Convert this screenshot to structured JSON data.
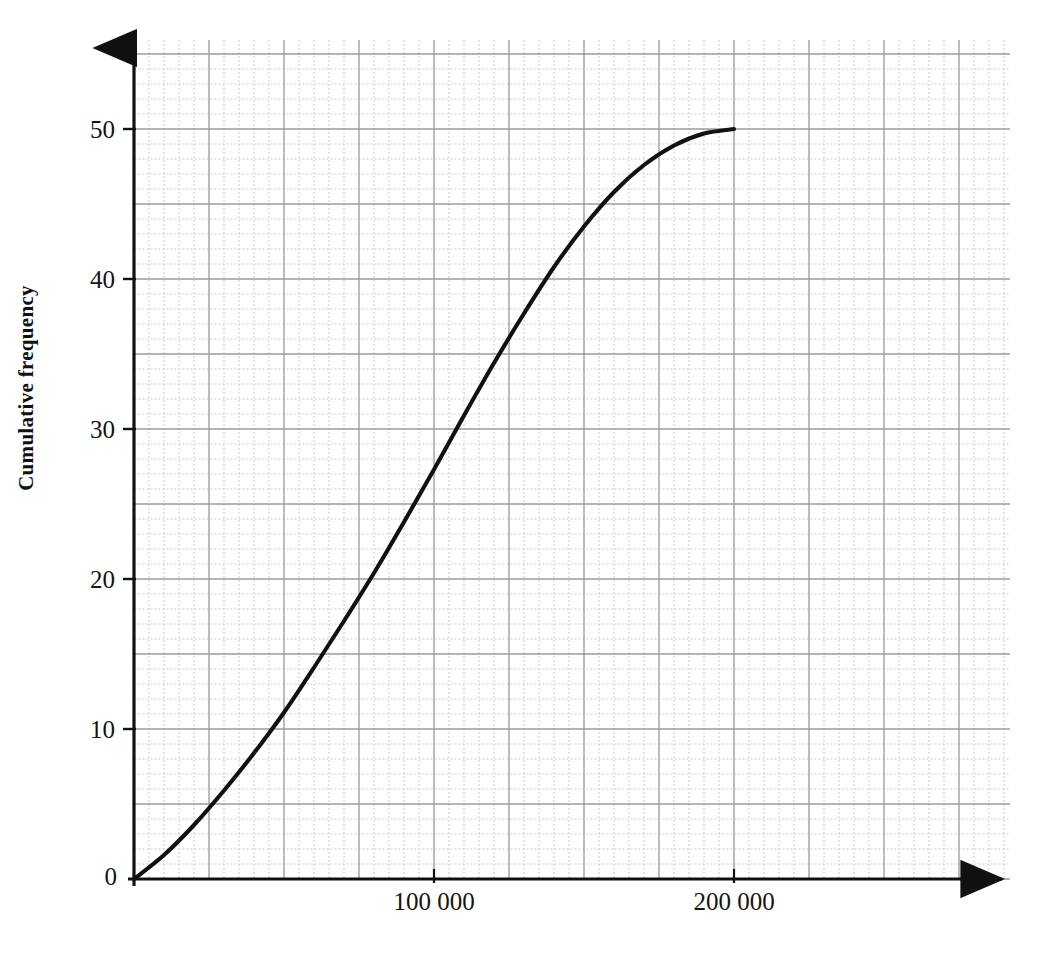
{
  "chart_data": {
    "type": "line",
    "title": "",
    "subtitle": "",
    "xlabel": "",
    "ylabel": "Cumulative frequency",
    "xlim": [
      0,
      233333
    ],
    "ylim": [
      0,
      56.7
    ],
    "grid": true,
    "grid_major_step_x": 25000,
    "grid_major_step_y": 5,
    "grid_minor_step_x": 5000,
    "grid_minor_step_y": 1,
    "legend": "none",
    "x_ticks": [
      {
        "value": 100000,
        "label": "100 000"
      },
      {
        "value": 200000,
        "label": "200 000"
      }
    ],
    "y_ticks": [
      {
        "value": 0,
        "label": "0"
      },
      {
        "value": 10,
        "label": "10"
      },
      {
        "value": 20,
        "label": "20"
      },
      {
        "value": 30,
        "label": "30"
      },
      {
        "value": 40,
        "label": "40"
      },
      {
        "value": 50,
        "label": "50"
      }
    ],
    "origin_label": "0",
    "series": [
      {
        "name": "Cumulative frequency curve",
        "color": "#111111",
        "x": [
          0,
          10000,
          20000,
          30000,
          40000,
          50000,
          60000,
          70000,
          80000,
          90000,
          100000,
          110000,
          120000,
          130000,
          140000,
          150000,
          160000,
          170000,
          180000,
          190000,
          200000
        ],
        "values": [
          0,
          1.6,
          3.6,
          5.9,
          8.4,
          11.1,
          14.1,
          17.2,
          20.4,
          23.8,
          27.3,
          30.9,
          34.4,
          37.7,
          40.8,
          43.5,
          45.8,
          47.6,
          48.9,
          49.7,
          50
        ]
      }
    ]
  },
  "axes": {
    "y_axis_name": "cumulative-frequency-axis",
    "x_axis_name": "value-axis"
  }
}
